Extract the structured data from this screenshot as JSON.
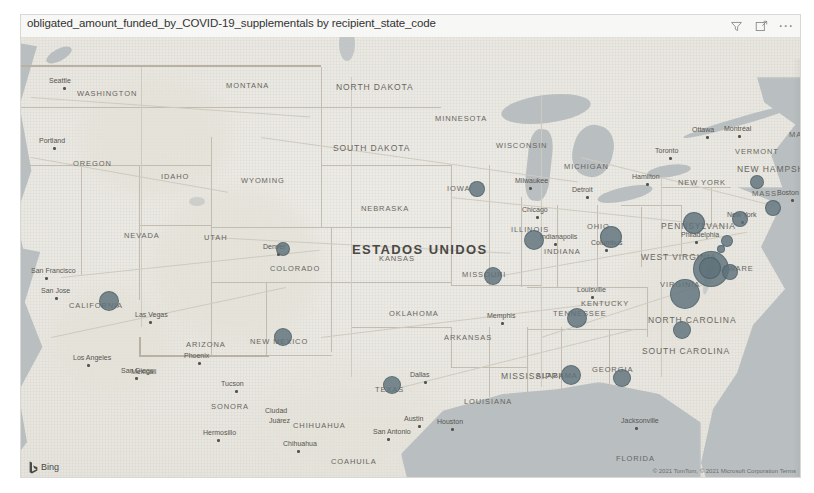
{
  "visual": {
    "title": "obligated_amount_funded_by_COVID-19_supplementals by recipient_state_code",
    "header_icons": [
      {
        "name": "filter-icon",
        "label": "Filters"
      },
      {
        "name": "focus-mode-icon",
        "label": "Focus mode"
      },
      {
        "name": "more-options-icon",
        "label": "More options"
      }
    ]
  },
  "map": {
    "provider_label": "Bing",
    "attribution": "© 2021 TomTom, © 2021 Microsoft Corporation Terms",
    "country_label": "ESTADOS UNIDOS",
    "sea_label": "Gulf of",
    "state_labels": [
      {
        "text": "WASHINGTON",
        "x": 56,
        "y": 52
      },
      {
        "text": "OREGON",
        "x": 52,
        "y": 122
      },
      {
        "text": "IDAHO",
        "x": 140,
        "y": 135
      },
      {
        "text": "MONTANA",
        "x": 205,
        "y": 44
      },
      {
        "text": "NORTH DAKOTA",
        "x": 315,
        "y": 45
      },
      {
        "text": "SOUTH DAKOTA",
        "x": 312,
        "y": 106
      },
      {
        "text": "MINNESOTA",
        "x": 414,
        "y": 77
      },
      {
        "text": "WISCONSIN",
        "x": 475,
        "y": 104
      },
      {
        "text": "WYOMING",
        "x": 220,
        "y": 139
      },
      {
        "text": "NEBRASKA",
        "x": 340,
        "y": 167
      },
      {
        "text": "IOWA",
        "x": 426,
        "y": 147
      },
      {
        "text": "NEVADA",
        "x": 103,
        "y": 194
      },
      {
        "text": "UTAH",
        "x": 183,
        "y": 196
      },
      {
        "text": "COLORADO",
        "x": 249,
        "y": 227
      },
      {
        "text": "KANSAS",
        "x": 358,
        "y": 217
      },
      {
        "text": "MISSOURI",
        "x": 441,
        "y": 233
      },
      {
        "text": "ILLINOIS",
        "x": 490,
        "y": 188
      },
      {
        "text": "MICHIGAN",
        "x": 543,
        "y": 125
      },
      {
        "text": "INDIANA",
        "x": 523,
        "y": 210
      },
      {
        "text": "KENTUCKY",
        "x": 560,
        "y": 262
      },
      {
        "text": "OHIO",
        "x": 566,
        "y": 185
      },
      {
        "text": "CALIFORNIA",
        "x": 48,
        "y": 264
      },
      {
        "text": "ARIZONA",
        "x": 165,
        "y": 303
      },
      {
        "text": "NEW MEXICO",
        "x": 229,
        "y": 300
      },
      {
        "text": "OKLAHOMA",
        "x": 368,
        "y": 272
      },
      {
        "text": "ARKANSAS",
        "x": 423,
        "y": 296
      },
      {
        "text": "TEXAS",
        "x": 354,
        "y": 348
      },
      {
        "text": "LOUISIANA",
        "x": 443,
        "y": 360
      },
      {
        "text": "MISSISSIPPI",
        "x": 480,
        "y": 334
      },
      {
        "text": "ALABAMA",
        "x": 515,
        "y": 334
      },
      {
        "text": "TENNESSEE",
        "x": 532,
        "y": 272
      },
      {
        "text": "GEORGIA",
        "x": 571,
        "y": 328
      },
      {
        "text": "SOUTH CAROLINA",
        "x": 621,
        "y": 309
      },
      {
        "text": "NORTH CAROLINA",
        "x": 627,
        "y": 278
      },
      {
        "text": "WEST VIRGINIA",
        "x": 620,
        "y": 215
      },
      {
        "text": "VIRGINIA",
        "x": 639,
        "y": 243
      },
      {
        "text": "PENNSYLVANIA",
        "x": 640,
        "y": 184
      },
      {
        "text": "DELAWARE",
        "x": 684,
        "y": 227
      },
      {
        "text": "NEW YORK",
        "x": 657,
        "y": 141
      },
      {
        "text": "VERMONT",
        "x": 714,
        "y": 110
      },
      {
        "text": "NEW HAMPSHIRE",
        "x": 716,
        "y": 127
      },
      {
        "text": "MASS.",
        "x": 731,
        "y": 152
      },
      {
        "text": "FLORIDA",
        "x": 595,
        "y": 417
      },
      {
        "text": "SONORA",
        "x": 190,
        "y": 365
      },
      {
        "text": "CHIHUAHUA",
        "x": 272,
        "y": 384
      },
      {
        "text": "COAHUILA",
        "x": 310,
        "y": 420
      },
      {
        "text": "MA",
        "x": 768,
        "y": 93
      }
    ],
    "city_labels": [
      {
        "text": "Seattle",
        "x": 28,
        "y": 40,
        "dot": true
      },
      {
        "text": "Portland",
        "x": 18,
        "y": 100,
        "dot": true
      },
      {
        "text": "San Francisco",
        "x": 10,
        "y": 230,
        "dot": true
      },
      {
        "text": "San Jose",
        "x": 20,
        "y": 250,
        "dot": true
      },
      {
        "text": "Las Vegas",
        "x": 114,
        "y": 274,
        "dot": true
      },
      {
        "text": "Los Angeles",
        "x": 52,
        "y": 317,
        "dot": true
      },
      {
        "text": "San Diego",
        "x": 100,
        "y": 330,
        "dot": true
      },
      {
        "text": "Phoenix",
        "x": 163,
        "y": 315,
        "dot": true
      },
      {
        "text": "Tucson",
        "x": 200,
        "y": 343,
        "dot": true
      },
      {
        "text": "Mexicali",
        "x": 110,
        "y": 331,
        "dot": false
      },
      {
        "text": "Ciudad",
        "x": 244,
        "y": 370,
        "dot": false
      },
      {
        "text": "Juárez",
        "x": 248,
        "y": 380,
        "dot": false
      },
      {
        "text": "Hermosillo",
        "x": 182,
        "y": 392,
        "dot": true
      },
      {
        "text": "Chihuahua",
        "x": 262,
        "y": 403,
        "dot": true
      },
      {
        "text": "Monterrey",
        "x": 400,
        "y": 448,
        "dot": true
      },
      {
        "text": "Denver",
        "x": 242,
        "y": 206,
        "dot": true
      },
      {
        "text": "Dallas",
        "x": 389,
        "y": 334,
        "dot": true
      },
      {
        "text": "Austin",
        "x": 383,
        "y": 378,
        "dot": true
      },
      {
        "text": "San Antonio",
        "x": 352,
        "y": 391,
        "dot": true
      },
      {
        "text": "Houston",
        "x": 416,
        "y": 381,
        "dot": true
      },
      {
        "text": "Memphis",
        "x": 466,
        "y": 275,
        "dot": true
      },
      {
        "text": "Milwaukee",
        "x": 494,
        "y": 140,
        "dot": true
      },
      {
        "text": "Chicago",
        "x": 501,
        "y": 169,
        "dot": true
      },
      {
        "text": "Indianapolis",
        "x": 519,
        "y": 196,
        "dot": true
      },
      {
        "text": "Columbus",
        "x": 570,
        "y": 202,
        "dot": true
      },
      {
        "text": "Louisville",
        "x": 556,
        "y": 249,
        "dot": true
      },
      {
        "text": "Detroit",
        "x": 551,
        "y": 149,
        "dot": true
      },
      {
        "text": "Hamilton",
        "x": 611,
        "y": 136,
        "dot": true
      },
      {
        "text": "Toronto",
        "x": 634,
        "y": 110,
        "dot": true
      },
      {
        "text": "Ottawa",
        "x": 671,
        "y": 89,
        "dot": true
      },
      {
        "text": "Montréal",
        "x": 703,
        "y": 88,
        "dot": true
      },
      {
        "text": "New York",
        "x": 706,
        "y": 174,
        "dot": true
      },
      {
        "text": "Philadelphia",
        "x": 660,
        "y": 194,
        "dot": true
      },
      {
        "text": "Boston",
        "x": 756,
        "y": 152,
        "dot": true
      },
      {
        "text": "Jacksonville",
        "x": 600,
        "y": 380,
        "dot": true
      }
    ],
    "bubbles": [
      {
        "name": "bubble-california",
        "x": 88,
        "y": 264,
        "r": 10
      },
      {
        "name": "bubble-new-mexico",
        "x": 262,
        "y": 300,
        "r": 9
      },
      {
        "name": "bubble-colorado",
        "x": 262,
        "y": 212,
        "r": 7
      },
      {
        "name": "bubble-texas",
        "x": 371,
        "y": 348,
        "r": 9
      },
      {
        "name": "bubble-iowa",
        "x": 456,
        "y": 152,
        "r": 8
      },
      {
        "name": "bubble-illinois",
        "x": 513,
        "y": 203,
        "r": 10
      },
      {
        "name": "bubble-missouri",
        "x": 472,
        "y": 239,
        "r": 9
      },
      {
        "name": "bubble-ohio",
        "x": 590,
        "y": 200,
        "r": 11
      },
      {
        "name": "bubble-tennessee",
        "x": 556,
        "y": 281,
        "r": 10
      },
      {
        "name": "bubble-alabama",
        "x": 550,
        "y": 338,
        "r": 10
      },
      {
        "name": "bubble-georgia",
        "x": 601,
        "y": 341,
        "r": 9
      },
      {
        "name": "bubble-north-carolina",
        "x": 661,
        "y": 293,
        "r": 9
      },
      {
        "name": "bubble-virginia",
        "x": 664,
        "y": 257,
        "r": 15
      },
      {
        "name": "bubble-maryland",
        "x": 690,
        "y": 232,
        "r": 18
      },
      {
        "name": "bubble-district-of-columbia",
        "x": 689,
        "y": 231,
        "r": 11
      },
      {
        "name": "bubble-delaware",
        "x": 709,
        "y": 235,
        "r": 8
      },
      {
        "name": "bubble-pennsylvania",
        "x": 673,
        "y": 186,
        "r": 11
      },
      {
        "name": "bubble-new-jersey",
        "x": 706,
        "y": 204,
        "r": 6
      },
      {
        "name": "bubble-new-jersey-south",
        "x": 700,
        "y": 212,
        "r": 4
      },
      {
        "name": "bubble-new-york",
        "x": 719,
        "y": 182,
        "r": 8
      },
      {
        "name": "bubble-massachusetts",
        "x": 752,
        "y": 171,
        "r": 8
      },
      {
        "name": "bubble-new-hampshire",
        "x": 736,
        "y": 145,
        "r": 7
      }
    ]
  }
}
